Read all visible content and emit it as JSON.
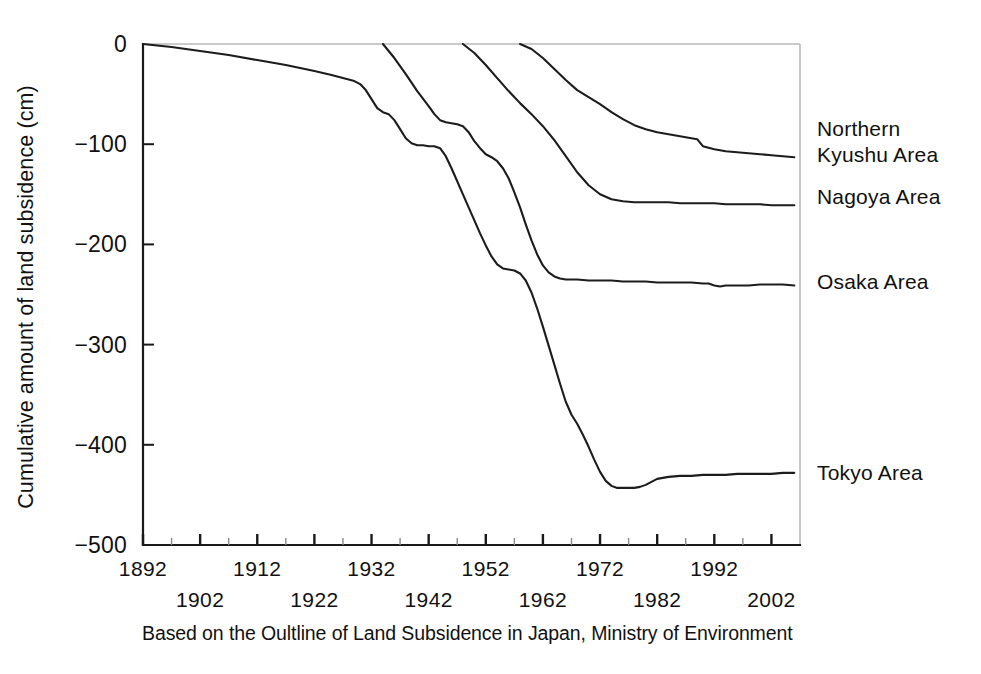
{
  "chart_data": {
    "type": "line",
    "title": "",
    "xlabel": "",
    "ylabel": "Cumulative amount of land subsidence (cm)",
    "caption": "Based on the Oultline of Land Subsidence in Japan, Ministry of Environment",
    "xlim": [
      1892,
      2007
    ],
    "ylim": [
      -500,
      0
    ],
    "yticks": [
      0,
      -100,
      -200,
      -300,
      -400,
      -500
    ],
    "ytick_labels": [
      "0",
      "−100",
      "−200",
      "−300",
      "−400",
      "−500"
    ],
    "xticks": [
      1892,
      1902,
      1912,
      1922,
      1932,
      1942,
      1952,
      1962,
      1972,
      1982,
      1992,
      2002
    ],
    "xtick_labels": [
      "1892",
      "1902",
      "1912",
      "1922",
      "1932",
      "1942",
      "1952",
      "1962",
      "1972",
      "1982",
      "1992",
      "2002"
    ],
    "xtick_label_rows": [
      0,
      1,
      0,
      1,
      0,
      1,
      0,
      1,
      0,
      1,
      0,
      1
    ],
    "grid": false,
    "legend_position": "right-inline",
    "line_color": "#1c1c1c",
    "axis_color": "#1a1a1a",
    "series": [
      {
        "name": "Northern Kyushu Area",
        "label_lines": [
          "Northern",
          "Kyushu Area"
        ],
        "label_y": -98,
        "end_value": -113,
        "points": [
          [
            1958,
            0
          ],
          [
            1960,
            -5
          ],
          [
            1962,
            -14
          ],
          [
            1964,
            -25
          ],
          [
            1966,
            -36
          ],
          [
            1968,
            -46
          ],
          [
            1970,
            -53
          ],
          [
            1972,
            -60
          ],
          [
            1974,
            -68
          ],
          [
            1976,
            -75
          ],
          [
            1978,
            -81
          ],
          [
            1980,
            -85
          ],
          [
            1982,
            -88
          ],
          [
            1984,
            -90
          ],
          [
            1986,
            -92
          ],
          [
            1988,
            -94
          ],
          [
            1989,
            -95
          ],
          [
            1990,
            -102
          ],
          [
            1992,
            -105
          ],
          [
            1994,
            -107
          ],
          [
            1996,
            -108
          ],
          [
            1998,
            -109
          ],
          [
            2000,
            -110
          ],
          [
            2002,
            -111
          ],
          [
            2004,
            -112
          ],
          [
            2006,
            -113
          ]
        ]
      },
      {
        "name": "Nagoya Area",
        "label_lines": [
          "Nagoya Area"
        ],
        "label_y": -153,
        "end_value": -161,
        "points": [
          [
            1948,
            0
          ],
          [
            1950,
            -9
          ],
          [
            1952,
            -21
          ],
          [
            1954,
            -34
          ],
          [
            1956,
            -47
          ],
          [
            1958,
            -59
          ],
          [
            1960,
            -70
          ],
          [
            1962,
            -82
          ],
          [
            1964,
            -96
          ],
          [
            1966,
            -112
          ],
          [
            1968,
            -128
          ],
          [
            1970,
            -141
          ],
          [
            1972,
            -150
          ],
          [
            1974,
            -155
          ],
          [
            1976,
            -157
          ],
          [
            1978,
            -158
          ],
          [
            1980,
            -158
          ],
          [
            1982,
            -158
          ],
          [
            1984,
            -158
          ],
          [
            1986,
            -159
          ],
          [
            1988,
            -159
          ],
          [
            1990,
            -159
          ],
          [
            1992,
            -159
          ],
          [
            1994,
            -160
          ],
          [
            1996,
            -160
          ],
          [
            1998,
            -160
          ],
          [
            2000,
            -160
          ],
          [
            2002,
            -161
          ],
          [
            2004,
            -161
          ],
          [
            2006,
            -161
          ]
        ]
      },
      {
        "name": "Osaka Area",
        "label_lines": [
          "Osaka Area"
        ],
        "label_y": -238,
        "end_value": -241,
        "points": [
          [
            1934,
            0
          ],
          [
            1936,
            -14
          ],
          [
            1938,
            -30
          ],
          [
            1940,
            -47
          ],
          [
            1942,
            -62
          ],
          [
            1943,
            -70
          ],
          [
            1944,
            -76
          ],
          [
            1945,
            -78
          ],
          [
            1946,
            -79
          ],
          [
            1947,
            -80
          ],
          [
            1948,
            -82
          ],
          [
            1949,
            -88
          ],
          [
            1950,
            -97
          ],
          [
            1951,
            -104
          ],
          [
            1952,
            -110
          ],
          [
            1953,
            -113
          ],
          [
            1954,
            -117
          ],
          [
            1955,
            -124
          ],
          [
            1956,
            -134
          ],
          [
            1957,
            -148
          ],
          [
            1958,
            -163
          ],
          [
            1959,
            -180
          ],
          [
            1960,
            -196
          ],
          [
            1961,
            -210
          ],
          [
            1962,
            -221
          ],
          [
            1963,
            -228
          ],
          [
            1964,
            -232
          ],
          [
            1965,
            -234
          ],
          [
            1966,
            -235
          ],
          [
            1968,
            -235
          ],
          [
            1970,
            -236
          ],
          [
            1972,
            -236
          ],
          [
            1974,
            -236
          ],
          [
            1976,
            -237
          ],
          [
            1978,
            -237
          ],
          [
            1980,
            -237
          ],
          [
            1982,
            -238
          ],
          [
            1984,
            -238
          ],
          [
            1986,
            -238
          ],
          [
            1988,
            -238
          ],
          [
            1990,
            -239
          ],
          [
            1991,
            -239
          ],
          [
            1992,
            -241
          ],
          [
            1993,
            -242
          ],
          [
            1994,
            -241
          ],
          [
            1996,
            -241
          ],
          [
            1998,
            -241
          ],
          [
            2000,
            -240
          ],
          [
            2002,
            -240
          ],
          [
            2004,
            -240
          ],
          [
            2006,
            -241
          ]
        ]
      },
      {
        "name": "Tokyo Area",
        "label_lines": [
          "Tokyo Area"
        ],
        "label_y": -428,
        "end_value": -428,
        "points": [
          [
            1892,
            0
          ],
          [
            1897,
            -3
          ],
          [
            1902,
            -7
          ],
          [
            1907,
            -11
          ],
          [
            1912,
            -16
          ],
          [
            1917,
            -21
          ],
          [
            1922,
            -27
          ],
          [
            1925,
            -31
          ],
          [
            1927,
            -34
          ],
          [
            1929,
            -37
          ],
          [
            1930,
            -40
          ],
          [
            1931,
            -46
          ],
          [
            1932,
            -55
          ],
          [
            1933,
            -64
          ],
          [
            1934,
            -68
          ],
          [
            1935,
            -70
          ],
          [
            1936,
            -76
          ],
          [
            1937,
            -85
          ],
          [
            1938,
            -94
          ],
          [
            1939,
            -99
          ],
          [
            1940,
            -101
          ],
          [
            1941,
            -101
          ],
          [
            1942,
            -102
          ],
          [
            1943,
            -102
          ],
          [
            1944,
            -104
          ],
          [
            1945,
            -112
          ],
          [
            1946,
            -124
          ],
          [
            1947,
            -137
          ],
          [
            1948,
            -150
          ],
          [
            1949,
            -163
          ],
          [
            1950,
            -176
          ],
          [
            1951,
            -189
          ],
          [
            1952,
            -201
          ],
          [
            1953,
            -212
          ],
          [
            1954,
            -220
          ],
          [
            1955,
            -224
          ],
          [
            1956,
            -225
          ],
          [
            1957,
            -226
          ],
          [
            1958,
            -229
          ],
          [
            1959,
            -236
          ],
          [
            1960,
            -248
          ],
          [
            1961,
            -264
          ],
          [
            1962,
            -282
          ],
          [
            1963,
            -301
          ],
          [
            1964,
            -320
          ],
          [
            1965,
            -339
          ],
          [
            1966,
            -357
          ],
          [
            1967,
            -370
          ],
          [
            1968,
            -379
          ],
          [
            1969,
            -390
          ],
          [
            1970,
            -402
          ],
          [
            1971,
            -415
          ],
          [
            1972,
            -427
          ],
          [
            1973,
            -436
          ],
          [
            1974,
            -441
          ],
          [
            1975,
            -443
          ],
          [
            1976,
            -443
          ],
          [
            1977,
            -443
          ],
          [
            1978,
            -443
          ],
          [
            1979,
            -442
          ],
          [
            1980,
            -440
          ],
          [
            1981,
            -437
          ],
          [
            1982,
            -434
          ],
          [
            1984,
            -432
          ],
          [
            1986,
            -431
          ],
          [
            1988,
            -431
          ],
          [
            1990,
            -430
          ],
          [
            1992,
            -430
          ],
          [
            1994,
            -430
          ],
          [
            1996,
            -429
          ],
          [
            1998,
            -429
          ],
          [
            2000,
            -429
          ],
          [
            2002,
            -429
          ],
          [
            2004,
            -428
          ],
          [
            2006,
            -428
          ]
        ]
      }
    ]
  }
}
